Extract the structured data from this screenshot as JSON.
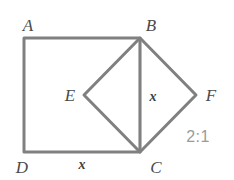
{
  "figure": {
    "type": "geometry-diagram",
    "width": 234,
    "height": 180,
    "background_color": "#ffffff",
    "stroke_color": "#808080",
    "stroke_width": 3
  },
  "shapes": {
    "square": {
      "name": "square-ABCD",
      "vertices": [
        {
          "id": "A",
          "x": 24,
          "y": 38
        },
        {
          "id": "B",
          "x": 140,
          "y": 38
        },
        {
          "id": "C",
          "x": 140,
          "y": 152
        },
        {
          "id": "D",
          "x": 24,
          "y": 152
        }
      ]
    },
    "diamond": {
      "name": "diamond-BFCE",
      "vertices": [
        {
          "id": "B",
          "x": 140,
          "y": 38
        },
        {
          "id": "F",
          "x": 196,
          "y": 95
        },
        {
          "id": "C",
          "x": 140,
          "y": 152
        },
        {
          "id": "E",
          "x": 84,
          "y": 95
        }
      ]
    },
    "diagonal": {
      "name": "segment-BC",
      "from": {
        "x": 140,
        "y": 38
      },
      "to": {
        "x": 140,
        "y": 152
      }
    }
  },
  "labels": {
    "vertices": [
      {
        "text": "A",
        "x": 28,
        "y": 25
      },
      {
        "text": "B",
        "x": 151,
        "y": 25
      },
      {
        "text": "E",
        "x": 70,
        "y": 95
      },
      {
        "text": "F",
        "x": 211,
        "y": 95
      },
      {
        "text": "D",
        "x": 22,
        "y": 167
      },
      {
        "text": "C",
        "x": 156,
        "y": 167
      }
    ],
    "sides": [
      {
        "text": "x",
        "x": 153,
        "y": 97
      },
      {
        "text": "x",
        "x": 82,
        "y": 165
      }
    ],
    "ratio": {
      "text": "2:1",
      "x": 198,
      "y": 137,
      "color": "#9a9a9a"
    }
  }
}
